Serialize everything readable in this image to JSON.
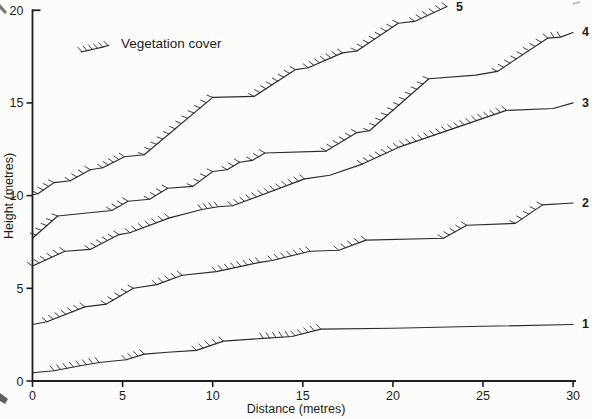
{
  "figure": {
    "legend_label": "Vegetation cover",
    "xlabel": "Distance (metres)",
    "ylabel": "Height (metres)",
    "colors": {
      "line": "#2b2b2b",
      "axis": "#1f1f1f",
      "text": "#1c1c1c",
      "background": "#fcfcfa"
    }
  },
  "chart_data": {
    "type": "line",
    "title": "",
    "xlabel": "Distance (metres)",
    "ylabel": "Height (metres)",
    "xlim": [
      0,
      30
    ],
    "ylim": [
      0,
      20
    ],
    "x_ticks": [
      0,
      5,
      10,
      15,
      20,
      25,
      30
    ],
    "y_ticks": [
      0,
      5,
      10,
      15,
      20
    ],
    "grid": false,
    "legend": [
      {
        "symbol": "hatched-line",
        "label": "Vegetation cover"
      }
    ],
    "series": [
      {
        "name": "1",
        "points": [
          [
            0,
            0.45
          ],
          [
            1.2,
            0.55
          ],
          [
            2.5,
            0.8
          ],
          [
            3.7,
            1.0
          ],
          [
            5.2,
            1.15
          ],
          [
            6.2,
            1.45
          ],
          [
            7.5,
            1.55
          ],
          [
            9.1,
            1.65
          ],
          [
            10.6,
            2.15
          ],
          [
            12.8,
            2.3
          ],
          [
            14.4,
            2.4
          ],
          [
            16.0,
            2.8
          ],
          [
            20.0,
            2.85
          ],
          [
            25.0,
            2.95
          ],
          [
            30.0,
            3.05
          ]
        ],
        "vegetation_cover_intervals": [
          [
            1.2,
            3.7
          ],
          [
            5.2,
            6.2
          ],
          [
            9.1,
            10.6
          ],
          [
            12.8,
            16.0
          ]
        ]
      },
      {
        "name": "2",
        "points": [
          [
            0,
            3.05
          ],
          [
            0.8,
            3.2
          ],
          [
            2.9,
            4.0
          ],
          [
            4.1,
            4.15
          ],
          [
            5.6,
            5.0
          ],
          [
            6.9,
            5.2
          ],
          [
            8.3,
            5.7
          ],
          [
            10.2,
            5.9
          ],
          [
            12.6,
            6.4
          ],
          [
            13.3,
            6.5
          ],
          [
            15.4,
            7.0
          ],
          [
            17.0,
            7.05
          ],
          [
            18.5,
            7.6
          ],
          [
            22.8,
            7.7
          ],
          [
            24.1,
            8.4
          ],
          [
            26.8,
            8.5
          ],
          [
            28.3,
            9.5
          ],
          [
            30.0,
            9.6
          ]
        ],
        "vegetation_cover_intervals": [
          [
            0.8,
            2.9
          ],
          [
            4.1,
            5.6
          ],
          [
            6.9,
            8.3
          ],
          [
            10.2,
            12.6
          ],
          [
            13.3,
            15.4
          ],
          [
            17.0,
            18.5
          ],
          [
            22.8,
            24.1
          ],
          [
            26.8,
            28.3
          ]
        ]
      },
      {
        "name": "3",
        "points": [
          [
            0,
            6.2
          ],
          [
            1.8,
            7.0
          ],
          [
            3.2,
            7.1
          ],
          [
            4.8,
            7.9
          ],
          [
            5.4,
            8.0
          ],
          [
            7.6,
            8.8
          ],
          [
            9.4,
            9.25
          ],
          [
            10.3,
            9.4
          ],
          [
            11.1,
            9.45
          ],
          [
            15.1,
            10.9
          ],
          [
            16.5,
            11.1
          ],
          [
            18.3,
            11.7
          ],
          [
            20.3,
            12.6
          ],
          [
            26.3,
            14.6
          ],
          [
            28.9,
            14.7
          ],
          [
            30.0,
            15.0
          ]
        ],
        "vegetation_cover_intervals": [
          [
            0,
            1.8
          ],
          [
            3.2,
            4.8
          ],
          [
            5.4,
            7.6
          ],
          [
            9.4,
            10.3
          ],
          [
            11.1,
            15.1
          ],
          [
            18.3,
            26.3
          ]
        ]
      },
      {
        "name": "4",
        "points": [
          [
            0,
            7.7
          ],
          [
            1.4,
            8.9
          ],
          [
            4.4,
            9.2
          ],
          [
            5.3,
            9.7
          ],
          [
            6.5,
            9.8
          ],
          [
            7.5,
            10.4
          ],
          [
            8.9,
            10.5
          ],
          [
            10.0,
            11.3
          ],
          [
            10.8,
            11.4
          ],
          [
            11.5,
            11.8
          ],
          [
            12.2,
            11.9
          ],
          [
            12.9,
            12.3
          ],
          [
            16.3,
            12.4
          ],
          [
            18.0,
            13.4
          ],
          [
            18.7,
            13.5
          ],
          [
            22.0,
            16.3
          ],
          [
            24.6,
            16.5
          ],
          [
            25.8,
            16.7
          ],
          [
            28.6,
            18.5
          ],
          [
            29.3,
            18.55
          ],
          [
            30.0,
            18.8
          ]
        ],
        "vegetation_cover_intervals": [
          [
            0.2,
            1.4
          ],
          [
            4.4,
            5.3
          ],
          [
            6.5,
            7.5
          ],
          [
            8.9,
            10.0
          ],
          [
            10.8,
            11.5
          ],
          [
            12.2,
            12.9
          ],
          [
            16.3,
            18.0
          ],
          [
            18.7,
            22.0
          ],
          [
            25.8,
            29.3
          ]
        ]
      },
      {
        "name": "5",
        "points": [
          [
            0,
            10.05
          ],
          [
            0.3,
            10.1
          ],
          [
            1.2,
            10.7
          ],
          [
            2.1,
            10.8
          ],
          [
            3.2,
            11.4
          ],
          [
            3.9,
            11.5
          ],
          [
            5.1,
            12.1
          ],
          [
            6.2,
            12.2
          ],
          [
            10.0,
            15.3
          ],
          [
            12.3,
            15.35
          ],
          [
            14.6,
            16.8
          ],
          [
            15.3,
            16.9
          ],
          [
            17.2,
            17.7
          ],
          [
            18.0,
            17.8
          ],
          [
            20.3,
            19.3
          ],
          [
            21.2,
            19.4
          ],
          [
            23.0,
            20.2
          ]
        ],
        "vegetation_cover_intervals": [
          [
            0.3,
            1.2
          ],
          [
            2.1,
            3.2
          ],
          [
            3.9,
            5.1
          ],
          [
            6.2,
            10.0
          ],
          [
            12.3,
            14.6
          ],
          [
            15.3,
            17.2
          ],
          [
            18.0,
            20.3
          ],
          [
            21.2,
            23.0
          ]
        ]
      }
    ]
  }
}
